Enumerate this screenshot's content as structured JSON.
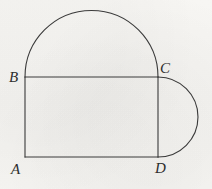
{
  "figure": {
    "name": "geometry-figure-rectangle-with-two-semicircles",
    "background_color": "#f6f5f2",
    "stroke_color": "#3a3a3a",
    "stroke_width": 1.1,
    "width": 212,
    "height": 189,
    "ghost_text": "",
    "vertices": [
      {
        "id": "A",
        "label": "A",
        "x": 25,
        "y": 157,
        "label_x": 11,
        "label_y": 162
      },
      {
        "id": "B",
        "label": "B",
        "x": 25,
        "y": 77,
        "label_x": 9,
        "label_y": 70
      },
      {
        "id": "C",
        "label": "C",
        "x": 158,
        "y": 77,
        "label_x": 160,
        "label_y": 61
      },
      {
        "id": "D",
        "label": "D",
        "x": 158,
        "y": 157,
        "label_x": 155,
        "label_y": 161
      }
    ],
    "segments": [
      {
        "name": "side-AB",
        "from": "A",
        "to": "B",
        "x1": 25,
        "y1": 157,
        "x2": 25,
        "y2": 77
      },
      {
        "name": "side-BC",
        "from": "B",
        "to": "C",
        "x1": 25,
        "y1": 77,
        "x2": 158,
        "y2": 77
      },
      {
        "name": "side-CD",
        "from": "C",
        "to": "D",
        "x1": 158,
        "y1": 77,
        "x2": 158,
        "y2": 157
      },
      {
        "name": "side-DA",
        "from": "D",
        "to": "A",
        "x1": 158,
        "y1": 157,
        "x2": 25,
        "y2": 157
      }
    ],
    "arcs": [
      {
        "name": "semicircle-on-BC",
        "diameter_endpoints": [
          "B",
          "C"
        ],
        "center_x": 91.5,
        "center_y": 77,
        "radius": 66.5,
        "bulge_direction": "up",
        "path": "M 25 77 A 66.5 66.5 0 0 1 158 77"
      },
      {
        "name": "semicircle-on-CD",
        "diameter_endpoints": [
          "C",
          "D"
        ],
        "center_x": 158,
        "center_y": 117,
        "radius": 40,
        "bulge_direction": "right",
        "path": "M 158 77 A 40 40 0 0 1 158 157"
      }
    ]
  }
}
